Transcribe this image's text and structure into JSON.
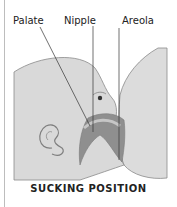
{
  "diagram": {
    "labels": {
      "palate": "Palate",
      "nipple": "Nipple",
      "areola": "Areola"
    },
    "caption": "SUCKING POSITION",
    "colors": {
      "skin": "#d9d9d9",
      "outline": "#8a8a8a",
      "mouth": "#9a9a9a",
      "mouth_dark": "#7d7d7d",
      "leader": "#333333"
    }
  }
}
